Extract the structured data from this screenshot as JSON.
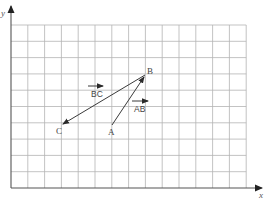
{
  "diagram": {
    "type": "coordinate-grid-vectors",
    "axes": {
      "x_label": "x",
      "y_label": "y"
    },
    "grid": {
      "origin_px": [
        11,
        188
      ],
      "cell_w_px": 16.8,
      "cell_h_px": 16.3,
      "cols": 14,
      "rows": 10
    },
    "points": [
      {
        "name": "A",
        "grid": [
          6,
          3.8
        ],
        "label": "A"
      },
      {
        "name": "B",
        "grid": [
          8,
          6.9
        ],
        "label": "B"
      },
      {
        "name": "C",
        "grid": [
          3,
          3.8
        ],
        "label": "C"
      }
    ],
    "vectors": [
      {
        "name": "AB",
        "from": "A",
        "to": "B",
        "label": "AB"
      },
      {
        "name": "BC",
        "from": "B",
        "to": "C",
        "label": "BC"
      }
    ],
    "labels": {
      "A": "A",
      "B": "B",
      "C": "C",
      "AB": "AB",
      "BC": "BC",
      "x": "x",
      "y": "y"
    }
  }
}
